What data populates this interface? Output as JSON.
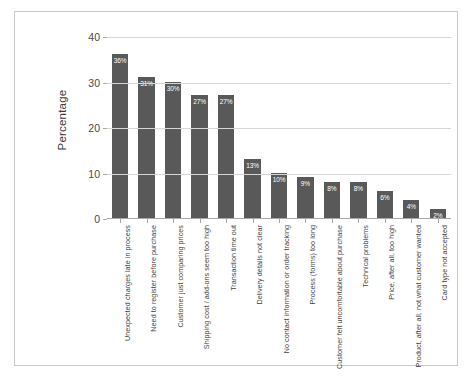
{
  "chart_data": {
    "type": "bar",
    "title": "",
    "subtitle": "",
    "xlabel": "",
    "ylabel": "Percentage",
    "ylim": [
      0,
      40
    ],
    "yticks": [
      0,
      10,
      20,
      30,
      40
    ],
    "ytick_labels": [
      "0",
      "10",
      "20",
      "30",
      "40"
    ],
    "grid": true,
    "legend": "none",
    "orientation": "vertical",
    "bar_color": "#595959",
    "value_label_color": "#ffffff",
    "value_label_suffix": "%",
    "categories": [
      "Unexpected charges late in process",
      "Need to register before purchase",
      "Customer just comparing prices",
      "Shipping cost / add-ons seem too high",
      "Transaction time out",
      "Delivery details not clear",
      "No contact information or order tracking",
      "Process (forms) too long",
      "Customer felt uncomfortable about purchase",
      "Technical problems",
      "Price, after all, too high",
      "Product, after all, not what customer wanted",
      "Card type not accepted"
    ],
    "values": [
      36,
      31,
      30,
      27,
      27,
      13,
      10,
      9,
      8,
      8,
      6,
      4,
      2
    ],
    "value_labels": [
      "36%",
      "31%",
      "30%",
      "27%",
      "27%",
      "13%",
      "10%",
      "9%",
      "8%",
      "8%",
      "6%",
      "4%",
      "2%"
    ]
  },
  "figure": {
    "border_color": "#c9c9c9",
    "background": "#ffffff",
    "gridline_color": "#d6d6d6",
    "axis_color": "#a8a8a8"
  }
}
